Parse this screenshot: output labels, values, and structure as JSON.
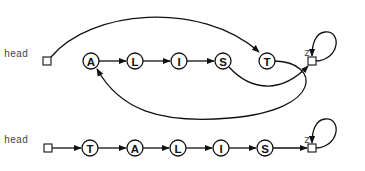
{
  "diagram": {
    "top": {
      "head_label": "head",
      "z_label": "z",
      "nodes": [
        "A",
        "L",
        "I",
        "S",
        "T"
      ]
    },
    "bottom": {
      "head_label": "head",
      "z_label": "z",
      "nodes": [
        "T",
        "A",
        "L",
        "I",
        "S"
      ]
    }
  }
}
